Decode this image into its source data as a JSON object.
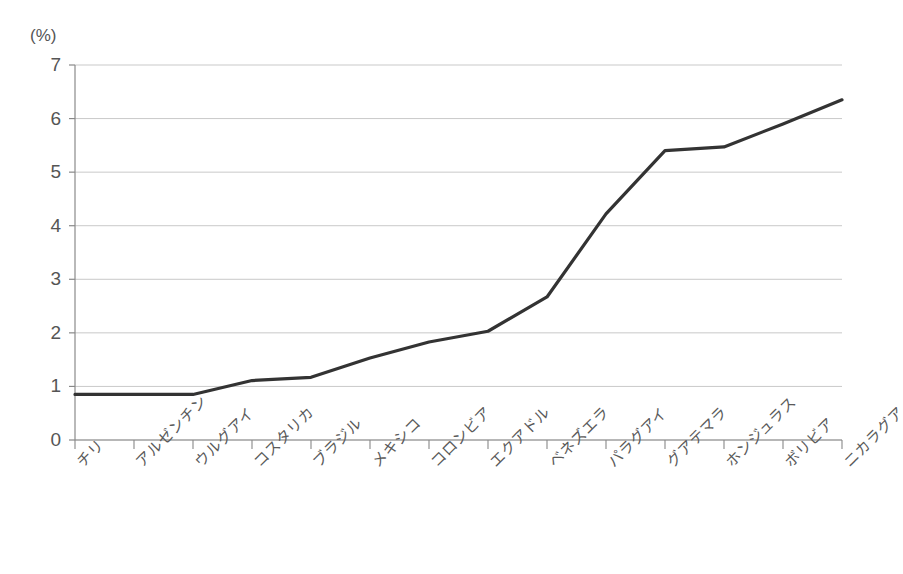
{
  "chart_data": {
    "type": "line",
    "title": "",
    "subtitle": "",
    "xlabel": "",
    "ylabel": "(%)",
    "unit_label": "(%)",
    "ylim": [
      0,
      7
    ],
    "ytick_step": 1,
    "yticks": [
      "7",
      "6",
      "5",
      "4",
      "3",
      "2",
      "1",
      "0"
    ],
    "grid": true,
    "grid_axis": "y",
    "legend": false,
    "legend_position": "none",
    "line_color": "#333333",
    "grid_color": "#c9c9c9",
    "axis_color": "#888888",
    "categories": [
      "チリ",
      "アルゼンチン",
      "ウルグアイ",
      "コスタリカ",
      "ブラジル",
      "メキシコ",
      "コロンビア",
      "エクアドル",
      "ベネズエラ",
      "パラグアイ",
      "グアテマラ",
      "ホンジュラス",
      "ボリビア",
      "ニカラグア"
    ],
    "values": [
      0.85,
      0.85,
      0.85,
      1.11,
      1.17,
      1.53,
      1.83,
      2.03,
      2.67,
      4.22,
      5.4,
      5.47,
      5.9,
      6.35
    ]
  }
}
